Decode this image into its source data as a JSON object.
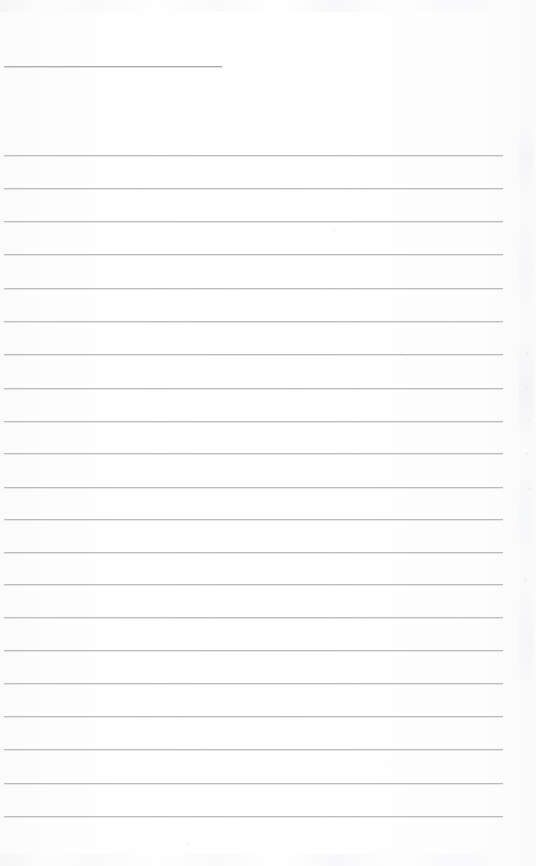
{
  "document": {
    "kind": "scanned-lined-page",
    "title": "",
    "body_text": "",
    "page_background_color": "#fdfdfd",
    "rule_color": "#b9bdc2",
    "page_width": 536,
    "page_height": 866
  },
  "header_rule": {
    "name": "header-underline",
    "x": 4,
    "y": 66,
    "width": 218,
    "color": "#a9adb2"
  },
  "ruled_lines": [
    {
      "index": 1,
      "y": 155,
      "x": 4,
      "width": 499,
      "text": ""
    },
    {
      "index": 2,
      "y": 188,
      "x": 4,
      "width": 499,
      "text": ""
    },
    {
      "index": 3,
      "y": 221,
      "x": 4,
      "width": 499,
      "text": ""
    },
    {
      "index": 4,
      "y": 254,
      "x": 4,
      "width": 499,
      "text": ""
    },
    {
      "index": 5,
      "y": 288,
      "x": 4,
      "width": 499,
      "text": ""
    },
    {
      "index": 6,
      "y": 321,
      "x": 4,
      "width": 499,
      "text": ""
    },
    {
      "index": 7,
      "y": 354,
      "x": 4,
      "width": 499,
      "text": ""
    },
    {
      "index": 8,
      "y": 388,
      "x": 4,
      "width": 499,
      "text": ""
    },
    {
      "index": 9,
      "y": 421,
      "x": 4,
      "width": 499,
      "text": ""
    },
    {
      "index": 10,
      "y": 453,
      "x": 4,
      "width": 499,
      "text": ""
    },
    {
      "index": 11,
      "y": 487,
      "x": 4,
      "width": 499,
      "text": ""
    },
    {
      "index": 12,
      "y": 519,
      "x": 4,
      "width": 499,
      "text": ""
    },
    {
      "index": 13,
      "y": 552,
      "x": 4,
      "width": 499,
      "text": ""
    },
    {
      "index": 14,
      "y": 584,
      "x": 4,
      "width": 499,
      "text": ""
    },
    {
      "index": 15,
      "y": 617,
      "x": 4,
      "width": 499,
      "text": ""
    },
    {
      "index": 16,
      "y": 650,
      "x": 4,
      "width": 499,
      "text": ""
    },
    {
      "index": 17,
      "y": 683,
      "x": 4,
      "width": 499,
      "text": ""
    },
    {
      "index": 18,
      "y": 716,
      "x": 4,
      "width": 499,
      "text": ""
    },
    {
      "index": 19,
      "y": 749,
      "x": 4,
      "width": 499,
      "text": ""
    },
    {
      "index": 20,
      "y": 783,
      "x": 4,
      "width": 499,
      "text": ""
    },
    {
      "index": 21,
      "y": 816,
      "x": 4,
      "width": 499,
      "text": ""
    }
  ],
  "scan_artifacts": {
    "margin_specks": [
      {
        "x": 526,
        "y": 352,
        "size": 3
      },
      {
        "x": 524,
        "y": 385,
        "size": 4
      },
      {
        "x": 527,
        "y": 419,
        "size": 3
      },
      {
        "x": 525,
        "y": 452,
        "size": 3
      },
      {
        "x": 528,
        "y": 487,
        "size": 3
      },
      {
        "x": 524,
        "y": 578,
        "size": 3
      },
      {
        "x": 527,
        "y": 660,
        "size": 3
      }
    ],
    "page_specks": [
      {
        "x": 186,
        "y": 843,
        "size": 2
      },
      {
        "x": 333,
        "y": 229,
        "size": 2
      },
      {
        "x": 400,
        "y": 351,
        "size": 2
      }
    ]
  }
}
